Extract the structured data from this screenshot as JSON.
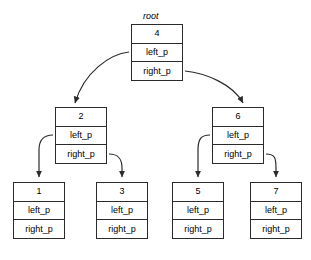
{
  "diagram": {
    "title_caption": "root",
    "field_labels": {
      "left": "left_p",
      "right": "right_p"
    },
    "colors": {
      "background": "#ffffff",
      "stroke": "#2b2b2b",
      "text": "#000000"
    },
    "nodes": [
      {
        "id": "root",
        "key": "4",
        "left_label": "left_p",
        "right_label": "right_p",
        "x": 131,
        "y": 24,
        "w": 52,
        "h": 57
      },
      {
        "id": "node-2",
        "key": "2",
        "left_label": "left_p",
        "right_label": "right_p",
        "x": 55,
        "y": 107,
        "w": 52,
        "h": 57
      },
      {
        "id": "node-6",
        "key": "6",
        "left_label": "left_p",
        "right_label": "right_p",
        "x": 212,
        "y": 107,
        "w": 52,
        "h": 57
      },
      {
        "id": "node-1",
        "key": "1",
        "left_label": "left_p",
        "right_label": "right_p",
        "x": 13,
        "y": 182,
        "w": 52,
        "h": 57
      },
      {
        "id": "node-3",
        "key": "3",
        "left_label": "left_p",
        "right_label": "right_p",
        "x": 96,
        "y": 182,
        "w": 52,
        "h": 57
      },
      {
        "id": "node-5",
        "key": "5",
        "left_label": "left_p",
        "right_label": "right_p",
        "x": 172,
        "y": 182,
        "w": 52,
        "h": 57
      },
      {
        "id": "node-7",
        "key": "7",
        "left_label": "left_p",
        "right_label": "right_p",
        "x": 250,
        "y": 182,
        "w": 52,
        "h": 57
      }
    ],
    "edges": [
      {
        "id": "edge-root-left",
        "from": "root",
        "from_field": "left_p",
        "to": "node-2"
      },
      {
        "id": "edge-root-right",
        "from": "root",
        "from_field": "right_p",
        "to": "node-6"
      },
      {
        "id": "edge-2-left",
        "from": "node-2",
        "from_field": "left_p",
        "to": "node-1"
      },
      {
        "id": "edge-2-right",
        "from": "node-2",
        "from_field": "right_p",
        "to": "node-3"
      },
      {
        "id": "edge-6-left",
        "from": "node-6",
        "from_field": "left_p",
        "to": "node-5"
      },
      {
        "id": "edge-6-right",
        "from": "node-6",
        "from_field": "right_p",
        "to": "node-7"
      }
    ],
    "caption_position": {
      "x": 143,
      "y": 11
    }
  }
}
